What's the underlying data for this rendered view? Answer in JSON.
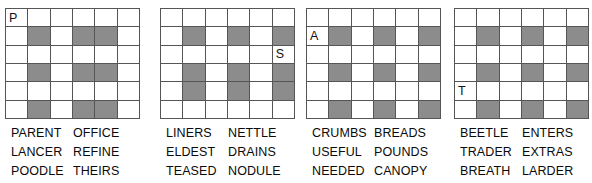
{
  "layout": {
    "panel_count": 4,
    "grid_rows": 6,
    "grid_cols": 6,
    "shaded_color": "#8c8c8c",
    "grid_line_color": "#555555",
    "background_color": "#ffffff",
    "text_color": "#0a0a0a"
  },
  "panels": [
    {
      "id": "panel-1",
      "letter": "P",
      "letter_row": 1,
      "letter_col": 1,
      "shaded_cells": [
        [
          2,
          2
        ],
        [
          2,
          4
        ],
        [
          2,
          5
        ],
        [
          4,
          2
        ],
        [
          4,
          4
        ],
        [
          4,
          5
        ],
        [
          6,
          2
        ],
        [
          6,
          4
        ],
        [
          6,
          5
        ]
      ],
      "word_rows": [
        {
          "left": "PARENT",
          "right": "OFFICE"
        },
        {
          "left": "LANCER",
          "right": "REFINE"
        },
        {
          "left": "POODLE",
          "right": "THEIRS"
        }
      ]
    },
    {
      "id": "panel-2",
      "letter": "S",
      "letter_row": 3,
      "letter_col": 6,
      "shaded_cells": [
        [
          2,
          2
        ],
        [
          2,
          4
        ],
        [
          2,
          6
        ],
        [
          4,
          2
        ],
        [
          4,
          4
        ],
        [
          4,
          6
        ],
        [
          5,
          2
        ],
        [
          5,
          4
        ],
        [
          5,
          6
        ]
      ],
      "word_rows": [
        {
          "left": "LINERS",
          "right": "NETTLE"
        },
        {
          "left": "ELDEST",
          "right": "DRAINS"
        },
        {
          "left": "TEASED",
          "right": "NODULE"
        }
      ]
    },
    {
      "id": "panel-3",
      "letter": "A",
      "letter_row": 2,
      "letter_col": 1,
      "shaded_cells": [
        [
          2,
          2
        ],
        [
          2,
          4
        ],
        [
          2,
          6
        ],
        [
          4,
          2
        ],
        [
          4,
          4
        ],
        [
          4,
          6
        ],
        [
          6,
          2
        ],
        [
          6,
          4
        ],
        [
          6,
          6
        ]
      ],
      "word_rows": [
        {
          "left": "CRUMBS",
          "right": "BREADS"
        },
        {
          "left": "USEFUL",
          "right": "POUNDS"
        },
        {
          "left": "NEEDED",
          "right": "CANOPY"
        }
      ]
    },
    {
      "id": "panel-4",
      "letter": "T",
      "letter_row": 5,
      "letter_col": 1,
      "shaded_cells": [
        [
          2,
          2
        ],
        [
          2,
          4
        ],
        [
          2,
          6
        ],
        [
          4,
          2
        ],
        [
          4,
          4
        ],
        [
          4,
          6
        ],
        [
          6,
          2
        ],
        [
          6,
          4
        ],
        [
          6,
          6
        ]
      ],
      "word_rows": [
        {
          "left": "BEETLE",
          "right": "ENTERS"
        },
        {
          "left": "TRADER",
          "right": "EXTRAS"
        },
        {
          "left": "BREATH",
          "right": "LARDER"
        }
      ]
    }
  ]
}
